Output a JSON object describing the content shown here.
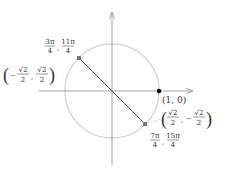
{
  "diagram": {
    "type": "unit-circle",
    "colors": {
      "circle": "#d8d8d8",
      "axes": "#8a8a8a",
      "segment": "#555555",
      "point_highlight": "#000000",
      "point_marker": "#777777",
      "text": "#333333"
    },
    "axes": {
      "x_axis": "x",
      "y_axis": "y"
    },
    "points": [
      {
        "id": "p0",
        "coord_label": "(1, 0)"
      },
      {
        "id": "p1",
        "angle_label_a_num": "3π",
        "angle_label_a_den": "4",
        "angle_label_b_num": "11π",
        "angle_label_b_den": "4",
        "coord_x_num": "√2",
        "coord_x_den": "2",
        "coord_x_sign": "−",
        "coord_y_num": "√2",
        "coord_y_den": "2",
        "coord_y_sign": ""
      },
      {
        "id": "p2",
        "angle_label_a_num": "7π",
        "angle_label_a_den": "4",
        "angle_label_b_num": "15π",
        "angle_label_b_den": "4",
        "coord_x_num": "√2",
        "coord_x_den": "2",
        "coord_x_sign": "",
        "coord_y_num": "√2",
        "coord_y_den": "2",
        "coord_y_sign": "−"
      }
    ],
    "separator": ","
  }
}
